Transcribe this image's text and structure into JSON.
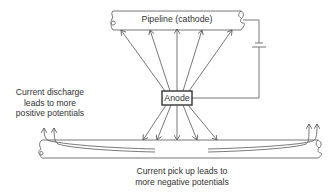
{
  "diagram": {
    "top_pipe_label": "Pipeline (cathode)",
    "anode_label": "Anode",
    "left_note": {
      "lines": [
        "Current discharge",
        "leads to more",
        "positive potentials"
      ]
    },
    "bottom_note": {
      "lines": [
        "Current pick up leads to",
        "more negative potentials"
      ]
    },
    "components": [
      "pipeline-cathode",
      "anode",
      "battery",
      "buried-pipeline"
    ],
    "colors": {
      "line": "#555555",
      "text": "#333333",
      "background": "#ffffff"
    }
  }
}
